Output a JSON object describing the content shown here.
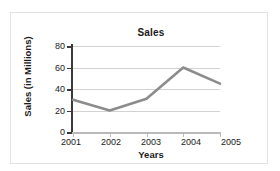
{
  "chart_data": {
    "type": "line",
    "title": "Sales",
    "xlabel": "Years",
    "ylabel": "Sales (in Millions)",
    "categories": [
      "2001",
      "2002",
      "2003",
      "2004",
      "2005"
    ],
    "values": [
      30,
      20,
      31,
      60,
      45
    ],
    "series": [
      {
        "name": "Sales",
        "values": [
          30,
          20,
          31,
          60,
          45
        ]
      }
    ],
    "ylim": [
      0,
      80
    ],
    "yticks": [
      "0",
      "20",
      "40",
      "60",
      "80"
    ],
    "ytick_values": [
      0,
      20,
      40,
      60,
      80
    ],
    "grid": true,
    "legend": "none",
    "line_color": "#8c8c8c",
    "axis_color": "#3a3a3a",
    "grid_color": "#d2d2d2"
  }
}
